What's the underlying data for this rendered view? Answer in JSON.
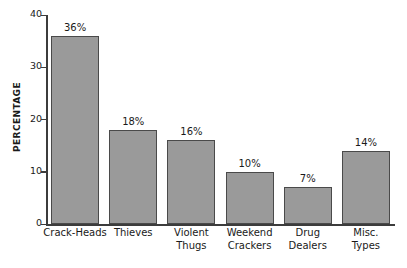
{
  "chart_data": {
    "type": "bar",
    "title": "",
    "xlabel": "",
    "ylabel": "PERCENTAGE",
    "ylim": [
      0,
      40
    ],
    "yticks": [
      0,
      10,
      20,
      30,
      40
    ],
    "grid": false,
    "legend": null,
    "categories": [
      "Crack-Heads",
      "Thieves",
      "Violent Thugs",
      "Weekend Crackers",
      "Drug Dealers",
      "Misc. Types"
    ],
    "category_lines": [
      [
        "Crack-Heads",
        ""
      ],
      [
        "Thieves",
        ""
      ],
      [
        "Violent",
        "Thugs"
      ],
      [
        "Weekend",
        "Crackers"
      ],
      [
        "Drug",
        "Dealers"
      ],
      [
        "Misc.",
        "Types"
      ]
    ],
    "values": [
      36,
      18,
      16,
      10,
      7,
      14
    ],
    "data_labels": [
      "36%",
      "18%",
      "16%",
      "10%",
      "7%",
      "14%"
    ],
    "bar_fill_color": "#9a9a9a",
    "bar_border_color": "#4a4a4a",
    "axis_color": "#3c3c3c",
    "background_color": "#ffffff"
  },
  "axis": {
    "y_title": "PERCENTAGE",
    "y_tick_labels": [
      "40",
      "30",
      "20",
      "10",
      "0"
    ]
  }
}
